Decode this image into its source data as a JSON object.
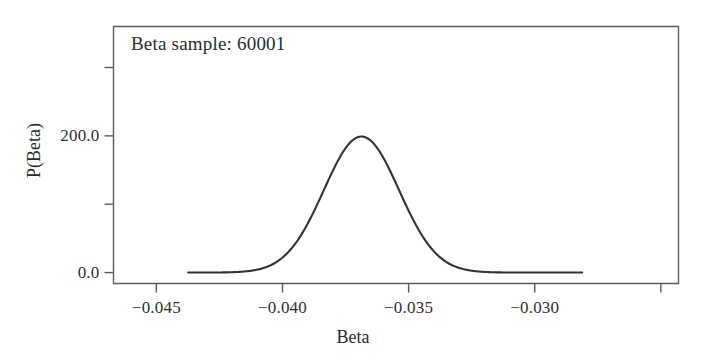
{
  "figure": {
    "annotation": "Beta sample: 60001",
    "x_axis_title": "Beta",
    "y_axis_title": "P(Beta)",
    "line_color": "#333333",
    "frame_color": "#5a5a5a",
    "background_color": "#ffffff"
  },
  "chart_data": {
    "type": "line",
    "title": "Beta sample: 60001",
    "xlabel": "Beta",
    "ylabel": "P(Beta)",
    "grid": false,
    "legend": "none",
    "xlim": [
      -0.0467,
      -0.0243
    ],
    "ylim": [
      -16.0,
      360.0
    ],
    "x_ticks": [
      -0.045,
      -0.04,
      -0.035,
      -0.03,
      -0.025
    ],
    "x_tick_labels": [
      "−0.045",
      "−0.040",
      "−0.035",
      "−0.030",
      ""
    ],
    "y_ticks": [
      0.0,
      100.0,
      200.0,
      300.0
    ],
    "y_tick_labels": [
      "0.0",
      "",
      "200.0",
      ""
    ],
    "distribution": {
      "shape": "gaussian",
      "mean": -0.03687,
      "sigma": 0.00149,
      "peak_value": 199.0,
      "x_start": -0.04374,
      "x_end": -0.02812
    },
    "series": [
      {
        "name": "P(Beta)",
        "x": [
          -0.04374,
          -0.0433,
          -0.0428,
          -0.0423,
          -0.0418,
          -0.0413,
          -0.0408,
          -0.0403,
          -0.0398,
          -0.0393,
          -0.0388,
          -0.0383,
          -0.0378,
          -0.0373,
          -0.03687,
          -0.0364,
          -0.0359,
          -0.0354,
          -0.0349,
          -0.0344,
          -0.0339,
          -0.0334,
          -0.0329,
          -0.0324,
          -0.0319,
          -0.0314,
          -0.0309,
          -0.0304,
          -0.0299,
          -0.0294,
          -0.0289,
          -0.02812
        ],
        "y": [
          0.4,
          0.8,
          1.7,
          3.3,
          6.3,
          11.4,
          19.7,
          32.5,
          51.0,
          76.3,
          108.8,
          147.9,
          191.7,
          198.7,
          199.0,
          197.5,
          170.7,
          134.0,
          99.3,
          69.8,
          46.6,
          29.6,
          17.9,
          10.3,
          5.6,
          2.9,
          1.4,
          0.7,
          0.3,
          0.1,
          0.1,
          0.0
        ]
      }
    ]
  }
}
